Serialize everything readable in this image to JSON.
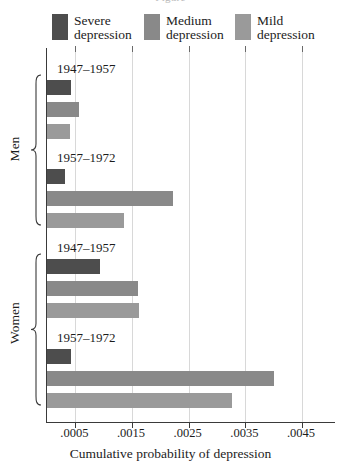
{
  "figure": {
    "cropped_header_text": "Figure",
    "axis_title": "Cumulative probability of depression"
  },
  "legend": {
    "items": [
      {
        "name": "severe",
        "label": "Severe\ndepression",
        "color": "#4d4d4d"
      },
      {
        "name": "medium",
        "label": "Medium\ndepression",
        "color": "#898989"
      },
      {
        "name": "mild",
        "label": "Mild\ndepression",
        "color": "#9a9a9a"
      }
    ]
  },
  "axis": {
    "tick_labels": [
      ".0005",
      ".0015",
      ".0025",
      ".0035",
      ".0045"
    ],
    "tick_values": [
      0.0005,
      0.0015,
      0.0025,
      0.0035,
      0.0045
    ],
    "min": 0,
    "max": 0.0051
  },
  "groups": [
    {
      "name": "men",
      "label": "Men"
    },
    {
      "name": "women",
      "label": "Women"
    }
  ],
  "chart_data": {
    "type": "bar",
    "orientation": "horizontal",
    "title": "",
    "xlabel": "Cumulative probability of depression",
    "ylabel": "",
    "xlim": [
      0,
      0.0051
    ],
    "grid": true,
    "legend_position": "top",
    "categories": [
      "Men 1947-1957",
      "Men 1957-1972",
      "Women 1947-1957",
      "Women 1957-1972"
    ],
    "series": [
      {
        "name": "Severe depression",
        "color": "#4d4d4d",
        "values": [
          0.00042,
          0.00032,
          0.00093,
          0.00042
        ]
      },
      {
        "name": "Medium depression",
        "color": "#898989",
        "values": [
          0.00056,
          0.00222,
          0.0016,
          0.00401
        ]
      },
      {
        "name": "Mild depression",
        "color": "#9a9a9a",
        "values": [
          0.00041,
          0.00136,
          0.00162,
          0.00326
        ]
      }
    ],
    "panels": [
      {
        "group": "Men",
        "cohorts": [
          {
            "period": "1947–1957",
            "severe": 0.00042,
            "medium": 0.00056,
            "mild": 0.00041
          },
          {
            "period": "1957–1972",
            "severe": 0.00032,
            "medium": 0.00222,
            "mild": 0.00136
          }
        ]
      },
      {
        "group": "Women",
        "cohorts": [
          {
            "period": "1947–1957",
            "severe": 0.00093,
            "medium": 0.0016,
            "mild": 0.00162
          },
          {
            "period": "1957–1972",
            "severe": 0.00042,
            "medium": 0.00401,
            "mild": 0.00326
          }
        ]
      }
    ]
  }
}
